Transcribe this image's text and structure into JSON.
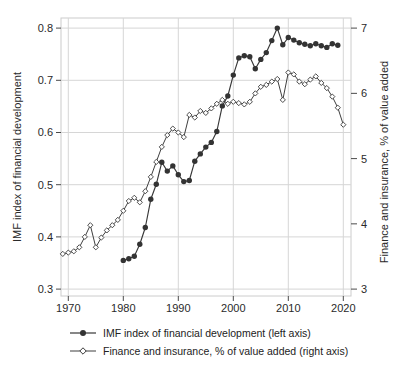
{
  "chart_data": {
    "type": "line",
    "title": "",
    "xlabel": "",
    "ylabel_left": "IMF index of financial development",
    "ylabel_right": "Finance and insurance, % of value added",
    "grid": true,
    "legend_position": "bottom",
    "x_axis": {
      "range": [
        1968.6,
        2021.3
      ],
      "tick_labels": [
        "1970",
        "1980",
        "1990",
        "2000",
        "2010",
        "2020"
      ],
      "tick_values": [
        1970,
        1980,
        1990,
        2000,
        2010,
        2020
      ]
    },
    "y_axis_left": {
      "range": [
        0.286,
        0.816
      ],
      "tick_labels": [
        "0.3",
        "0.4",
        "0.5",
        "0.6",
        "0.7",
        "0.8"
      ],
      "tick_values": [
        0.3,
        0.4,
        0.5,
        0.6,
        0.7,
        0.8
      ]
    },
    "y_axis_right": {
      "range": [
        2.9,
        7.12
      ],
      "tick_labels": [
        "3",
        "4",
        "5",
        "6",
        "7"
      ],
      "tick_values": [
        3,
        4,
        5,
        6,
        7
      ]
    },
    "series": [
      {
        "name": "IMF index of financial development",
        "legend_label": "IMF index of financial development (left axis)",
        "axis": "left",
        "marker": "filled-circle",
        "color": "#383838",
        "years": [
          1980,
          1981,
          1982,
          1983,
          1984,
          1985,
          1986,
          1987,
          1988,
          1989,
          1990,
          1991,
          1992,
          1993,
          1994,
          1995,
          1996,
          1997,
          1998,
          1999,
          2000,
          2001,
          2002,
          2003,
          2004,
          2005,
          2006,
          2007,
          2008,
          2009,
          2010,
          2011,
          2012,
          2013,
          2014,
          2015,
          2016,
          2017,
          2018,
          2019
        ],
        "values": [
          0.355,
          0.358,
          0.363,
          0.386,
          0.418,
          0.472,
          0.501,
          0.543,
          0.526,
          0.536,
          0.519,
          0.506,
          0.508,
          0.545,
          0.559,
          0.572,
          0.581,
          0.602,
          0.651,
          0.67,
          0.71,
          0.743,
          0.747,
          0.745,
          0.722,
          0.74,
          0.753,
          0.776,
          0.8,
          0.768,
          0.782,
          0.777,
          0.772,
          0.769,
          0.766,
          0.77,
          0.766,
          0.763,
          0.77,
          0.767
        ]
      },
      {
        "name": "Finance and insurance, % of value added",
        "legend_label": "Finance and insurance, % of value added (right axis)",
        "axis": "right",
        "marker": "open-diamond",
        "color": "#3f3f3f",
        "years": [
          1969,
          1970,
          1971,
          1972,
          1973,
          1974,
          1975,
          1976,
          1977,
          1978,
          1979,
          1980,
          1981,
          1982,
          1983,
          1984,
          1985,
          1986,
          1987,
          1988,
          1989,
          1990,
          1991,
          1992,
          1993,
          1994,
          1995,
          1996,
          1997,
          1998,
          1999,
          2000,
          2001,
          2002,
          2003,
          2004,
          2005,
          2006,
          2007,
          2008,
          2009,
          2010,
          2011,
          2012,
          2013,
          2014,
          2015,
          2016,
          2017,
          2018,
          2019,
          2020
        ],
        "values": [
          3.54,
          3.56,
          3.58,
          3.64,
          3.8,
          3.98,
          3.64,
          3.79,
          3.9,
          3.98,
          4.06,
          4.2,
          4.35,
          4.4,
          4.33,
          4.5,
          4.72,
          4.95,
          5.18,
          5.36,
          5.46,
          5.4,
          5.33,
          5.67,
          5.63,
          5.73,
          5.7,
          5.77,
          5.84,
          5.9,
          5.84,
          5.87,
          5.85,
          5.83,
          5.87,
          6.0,
          6.1,
          6.13,
          6.18,
          6.22,
          5.9,
          6.32,
          6.29,
          6.18,
          6.14,
          6.21,
          6.26,
          6.16,
          6.08,
          5.95,
          5.78,
          5.52
        ]
      }
    ]
  },
  "colors": {
    "background": "#ffffff",
    "gridline": "#d6d6d6",
    "frame": "#cccccc",
    "tick": "#4a4a4a",
    "tick_label": "#2a2a2a",
    "series_line": "#3a3a3a"
  }
}
